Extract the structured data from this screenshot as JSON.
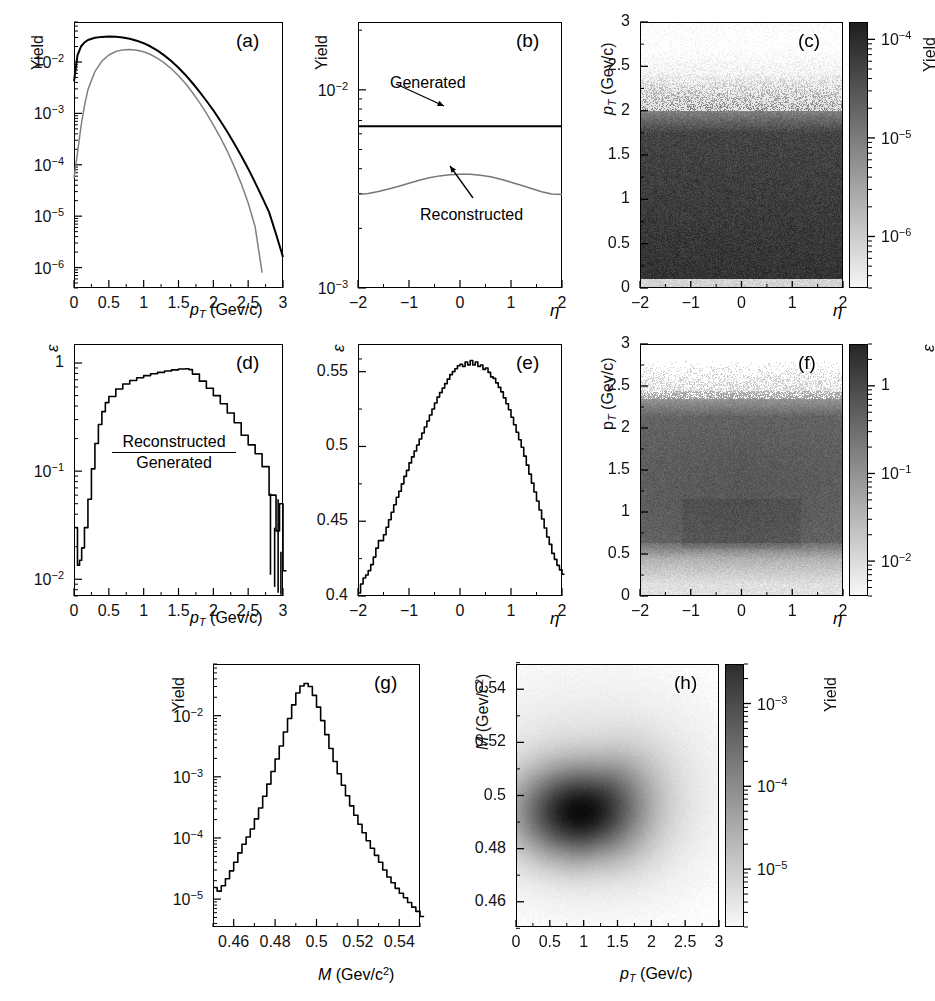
{
  "figure": {
    "kind": "multi-panel scientific figure",
    "panel_labels": [
      "(a)",
      "(b)",
      "(c)",
      "(d)",
      "(e)",
      "(f)",
      "(g)",
      "(h)"
    ]
  },
  "labels": {
    "yield": "Yield",
    "epsilon": "ε",
    "eta": "η",
    "pt_axis": "p_T (Gev/c)",
    "mass_axis": "M (Gev/c²)",
    "generated": "Generated",
    "reconstructed": "Reconstructed"
  },
  "chart_data": [
    {
      "id": "a",
      "panel": "(a)",
      "type": "line",
      "title": "",
      "xlabel": "p_T (Gev/c)",
      "ylabel": "Yield",
      "yscale": "log",
      "xlim": [
        0,
        3
      ],
      "ylim": [
        4e-07,
        0.06
      ],
      "xticks": [
        "0",
        "0.5",
        "1",
        "1.5",
        "2",
        "2.5",
        "3"
      ],
      "xtickvals": [
        0,
        0.5,
        1,
        1.5,
        2,
        2.5,
        3
      ],
      "yticks": [
        "10⁻²",
        "10⁻³",
        "10⁻⁴",
        "10⁻⁵",
        "10⁻⁶"
      ],
      "ytickvals": [
        0.01,
        0.001,
        0.0001,
        1e-05,
        1e-06
      ],
      "grid": false,
      "legend": "none",
      "series": [
        {
          "name": "Generated",
          "color": "#000000",
          "x": [
            0.0,
            0.05,
            0.1,
            0.15,
            0.2,
            0.3,
            0.4,
            0.5,
            0.6,
            0.7,
            0.8,
            0.9,
            1.0,
            1.1,
            1.2,
            1.3,
            1.4,
            1.5,
            1.6,
            1.7,
            1.8,
            1.9,
            2.0,
            2.1,
            2.2,
            2.3,
            2.4,
            2.5,
            2.6,
            2.7,
            2.8,
            2.9,
            3.0
          ],
          "y": [
            0.0042,
            0.0135,
            0.02,
            0.024,
            0.0268,
            0.0296,
            0.0308,
            0.0312,
            0.031,
            0.03,
            0.0283,
            0.026,
            0.0232,
            0.02,
            0.0166,
            0.0133,
            0.0103,
            0.0077,
            0.0056,
            0.0039,
            0.00265,
            0.00176,
            0.00115,
            0.00072,
            0.00044,
            0.00026,
            0.00015,
            8.4e-05,
            4.5e-05,
            2.35e-05,
            1.2e-05,
            4.5e-06,
            1.6e-06
          ]
        },
        {
          "name": "Reconstructed",
          "color": "#808080",
          "x": [
            0.0,
            0.05,
            0.1,
            0.15,
            0.2,
            0.3,
            0.4,
            0.5,
            0.6,
            0.7,
            0.8,
            0.9,
            1.0,
            1.1,
            1.2,
            1.3,
            1.4,
            1.5,
            1.6,
            1.7,
            1.8,
            1.9,
            2.0,
            2.1,
            2.2,
            2.3,
            2.4,
            2.5,
            2.6,
            2.7
          ],
          "y": [
            5.5e-05,
            0.00017,
            0.00055,
            0.0014,
            0.0029,
            0.0065,
            0.0104,
            0.0137,
            0.016,
            0.0172,
            0.0175,
            0.017,
            0.0158,
            0.014,
            0.0118,
            0.0095,
            0.0073,
            0.0054,
            0.0038,
            0.00255,
            0.00164,
            0.00101,
            0.0006,
            0.00034,
            0.000185,
            9.2e-05,
            4.3e-05,
            1.8e-05,
            6.2e-06,
            8e-07
          ]
        }
      ]
    },
    {
      "id": "b",
      "panel": "(b)",
      "type": "line",
      "xlabel": "η",
      "ylabel": "Yield",
      "yscale": "log",
      "xlim": [
        -2,
        2
      ],
      "ylim": [
        0.001,
        0.022
      ],
      "xticks": [
        "−2",
        "−1",
        "0",
        "1",
        "2"
      ],
      "xtickvals": [
        -2,
        -1,
        0,
        1,
        2
      ],
      "yticks": [
        "10⁻²",
        "10⁻³"
      ],
      "ytickvals": [
        0.01,
        0.001
      ],
      "annotations": [
        {
          "text": "Generated",
          "x": -1.35,
          "y": 0.0125
        },
        {
          "text": "Reconstructed",
          "x": 0.15,
          "y": 0.00195
        }
      ],
      "series": [
        {
          "name": "Generated",
          "color": "#000000",
          "x": [
            -2,
            -1.5,
            -1,
            -0.5,
            0,
            0.5,
            1,
            1.5,
            2
          ],
          "y": [
            0.00655,
            0.00655,
            0.00655,
            0.00655,
            0.00655,
            0.00655,
            0.00655,
            0.00655,
            0.00655
          ]
        },
        {
          "name": "Reconstructed",
          "color": "#777777",
          "x": [
            -2.0,
            -1.8,
            -1.6,
            -1.4,
            -1.2,
            -1.0,
            -0.8,
            -0.6,
            -0.4,
            -0.2,
            0.0,
            0.2,
            0.4,
            0.6,
            0.8,
            1.0,
            1.2,
            1.4,
            1.6,
            1.8,
            2.0
          ],
          "y": [
            0.00296,
            0.003,
            0.00307,
            0.00316,
            0.00326,
            0.00338,
            0.0035,
            0.0036,
            0.00368,
            0.00373,
            0.00375,
            0.00375,
            0.00371,
            0.00364,
            0.00354,
            0.00342,
            0.0033,
            0.00318,
            0.00306,
            0.00298,
            0.00296
          ]
        }
      ]
    },
    {
      "id": "c",
      "panel": "(c)",
      "type": "heatmap",
      "xlabel": "η",
      "ylabel": "p_T (Gev/c)",
      "xlim": [
        -2,
        2
      ],
      "ylim": [
        0,
        3
      ],
      "xticks": [
        "−2",
        "−1",
        "0",
        "1",
        "2"
      ],
      "xtickvals": [
        -2,
        -1,
        0,
        1,
        2
      ],
      "yticks": [
        "0",
        "0.5",
        "1",
        "1.5",
        "2",
        "2.5",
        "3"
      ],
      "ytickvals": [
        0,
        0.5,
        1,
        1.5,
        2,
        2.5,
        3
      ],
      "colorbar": {
        "label": "Yield",
        "scale": "log",
        "ticks": [
          "10⁻⁴",
          "10⁻⁵",
          "10⁻⁶"
        ],
        "tickvals": [
          0.0001,
          1e-05,
          1e-06
        ],
        "vmin": 3e-07,
        "vmax": 0.00015
      },
      "description": "Yield density in η vs p_T: dark (high yield) for p_T below ~1.8, fading to light above 2.3, faint band at p_T<0.1."
    },
    {
      "id": "d",
      "panel": "(d)",
      "type": "line",
      "xlabel": "p_T (Gev/c)",
      "ylabel": "ε",
      "yscale": "log",
      "xlim": [
        0,
        3
      ],
      "ylim": [
        0.007,
        1.5
      ],
      "xticks": [
        "0",
        "0.5",
        "1",
        "1.5",
        "2",
        "2.5",
        "3"
      ],
      "xtickvals": [
        0,
        0.5,
        1,
        1.5,
        2,
        2.5,
        3
      ],
      "yticks": [
        "1",
        "10⁻¹",
        "10⁻²"
      ],
      "ytickvals": [
        1,
        0.1,
        0.01
      ],
      "annotations": [
        {
          "text": "Reconstructed",
          "x": 1.0,
          "y": 0.3
        },
        {
          "text": "Generated",
          "x": 1.0,
          "y": 0.13
        }
      ],
      "series": [
        {
          "name": "efficiency",
          "color": "#000000",
          "x": [
            0.02,
            0.05,
            0.08,
            0.11,
            0.15,
            0.2,
            0.25,
            0.3,
            0.35,
            0.4,
            0.45,
            0.5,
            0.6,
            0.7,
            0.8,
            0.9,
            1.0,
            1.1,
            1.2,
            1.3,
            1.4,
            1.5,
            1.6,
            1.65,
            1.7,
            1.8,
            1.9,
            2.0,
            2.1,
            2.2,
            2.3,
            2.4,
            2.5,
            2.6,
            2.7,
            2.8,
            2.9,
            2.95,
            3.0
          ],
          "y": [
            0.03,
            0.0135,
            0.015,
            0.0195,
            0.03,
            0.055,
            0.105,
            0.18,
            0.27,
            0.355,
            0.43,
            0.49,
            0.575,
            0.64,
            0.69,
            0.73,
            0.765,
            0.795,
            0.82,
            0.845,
            0.865,
            0.88,
            0.885,
            0.87,
            0.79,
            0.68,
            0.585,
            0.5,
            0.42,
            0.345,
            0.28,
            0.215,
            0.175,
            0.145,
            0.11,
            0.06,
            0.028,
            0.05,
            0.012
          ]
        }
      ]
    },
    {
      "id": "e",
      "panel": "(e)",
      "type": "line",
      "xlabel": "η",
      "ylabel": "ε",
      "yscale": "linear",
      "xlim": [
        -2,
        2
      ],
      "ylim": [
        0.4,
        0.5685
      ],
      "xticks": [
        "−2",
        "−1",
        "0",
        "1",
        "2"
      ],
      "xtickvals": [
        -2,
        -1,
        0,
        1,
        2
      ],
      "yticks": [
        "0.55",
        "0.5",
        "0.45",
        "0.4"
      ],
      "ytickvals": [
        0.55,
        0.5,
        0.45,
        0.4
      ],
      "series": [
        {
          "name": "efficiency",
          "color": "#000000",
          "x": [
            -2.0,
            -1.95,
            -1.9,
            -1.85,
            -1.8,
            -1.75,
            -1.7,
            -1.65,
            -1.6,
            -1.55,
            -1.5,
            -1.45,
            -1.4,
            -1.35,
            -1.3,
            -1.25,
            -1.2,
            -1.15,
            -1.1,
            -1.05,
            -1.0,
            -0.95,
            -0.9,
            -0.85,
            -0.8,
            -0.75,
            -0.7,
            -0.65,
            -0.6,
            -0.55,
            -0.5,
            -0.45,
            -0.4,
            -0.35,
            -0.3,
            -0.25,
            -0.2,
            -0.15,
            -0.1,
            -0.05,
            0.0,
            0.05,
            0.1,
            0.15,
            0.2,
            0.25,
            0.3,
            0.35,
            0.4,
            0.45,
            0.5,
            0.55,
            0.6,
            0.65,
            0.7,
            0.75,
            0.8,
            0.85,
            0.9,
            0.95,
            1.0,
            1.05,
            1.1,
            1.15,
            1.2,
            1.25,
            1.3,
            1.35,
            1.4,
            1.45,
            1.5,
            1.55,
            1.6,
            1.65,
            1.7,
            1.75,
            1.8,
            1.85,
            1.9,
            1.95,
            2.0
          ],
          "y": [
            0.402,
            0.408,
            0.412,
            0.414,
            0.417,
            0.421,
            0.426,
            0.432,
            0.437,
            0.437,
            0.441,
            0.446,
            0.451,
            0.456,
            0.461,
            0.466,
            0.47,
            0.475,
            0.48,
            0.484,
            0.489,
            0.493,
            0.497,
            0.501,
            0.505,
            0.509,
            0.513,
            0.517,
            0.521,
            0.525,
            0.529,
            0.533,
            0.536,
            0.539,
            0.542,
            0.545,
            0.548,
            0.55,
            0.552,
            0.554,
            0.555,
            0.5535,
            0.5565,
            0.5545,
            0.5575,
            0.5545,
            0.5565,
            0.5535,
            0.5545,
            0.5515,
            0.5525,
            0.5495,
            0.5465,
            0.5455,
            0.5425,
            0.5395,
            0.5365,
            0.5325,
            0.5285,
            0.5245,
            0.5195,
            0.5145,
            0.5095,
            0.5045,
            0.4995,
            0.4935,
            0.4875,
            0.4815,
            0.4755,
            0.4695,
            0.4635,
            0.4575,
            0.4515,
            0.4455,
            0.4395,
            0.4345,
            0.4285,
            0.4245,
            0.4205,
            0.4175,
            0.4145
          ]
        }
      ]
    },
    {
      "id": "f",
      "panel": "(f)",
      "type": "heatmap",
      "xlabel": "η",
      "ylabel": "p_T (Gev/c)",
      "xlim": [
        -2,
        2
      ],
      "ylim": [
        0,
        3
      ],
      "xticks": [
        "−2",
        "−1",
        "0",
        "1",
        "2"
      ],
      "xtickvals": [
        -2,
        -1,
        0,
        1,
        2
      ],
      "yticks": [
        "0",
        "0.5",
        "1",
        "1.5",
        "2",
        "2.5",
        "3"
      ],
      "ytickvals": [
        0,
        0.5,
        1,
        1.5,
        2,
        2.5,
        3
      ],
      "colorbar": {
        "label": "ε",
        "scale": "log",
        "ticks": [
          "1",
          "10⁻¹",
          "10⁻²"
        ],
        "tickvals": [
          1,
          0.1,
          0.01
        ],
        "vmin": 0.004,
        "vmax": 3.0
      },
      "description": "Efficiency map in η vs p_T: mid-grey plateau for 0.7<p_T<2.2, lighter band below 0.5 and sparse speckle above 2.4."
    },
    {
      "id": "g",
      "panel": "(g)",
      "type": "line",
      "xlabel": "M (Gev/c²)",
      "ylabel": "Yield",
      "yscale": "log",
      "xlim": [
        0.45,
        0.55
      ],
      "ylim": [
        3.5e-06,
        0.07
      ],
      "xticks": [
        "0.46",
        "0.48",
        "0.5",
        "0.52",
        "0.54"
      ],
      "xtickvals": [
        0.46,
        0.48,
        0.5,
        0.52,
        0.54
      ],
      "yticks": [
        "10⁻²",
        "10⁻³",
        "10⁻⁴",
        "10⁻⁵"
      ],
      "ytickvals": [
        0.01,
        0.001,
        0.0001,
        1e-05
      ],
      "series": [
        {
          "name": "invariant mass",
          "color": "#000000",
          "x": [
            0.45,
            0.452,
            0.454,
            0.456,
            0.458,
            0.46,
            0.462,
            0.464,
            0.466,
            0.468,
            0.47,
            0.472,
            0.474,
            0.476,
            0.478,
            0.48,
            0.482,
            0.484,
            0.486,
            0.488,
            0.49,
            0.492,
            0.494,
            0.496,
            0.498,
            0.5,
            0.502,
            0.504,
            0.506,
            0.508,
            0.51,
            0.512,
            0.514,
            0.516,
            0.518,
            0.52,
            0.522,
            0.524,
            0.526,
            0.528,
            0.53,
            0.532,
            0.534,
            0.536,
            0.538,
            0.54,
            0.542,
            0.544,
            0.546,
            0.548,
            0.55
          ],
          "y": [
            1.55e-05,
            1.35e-05,
            1.65e-05,
            2.15e-05,
            2.9e-05,
            4e-05,
            5.7e-05,
            7.9e-05,
            0.000104,
            0.00014,
            0.000205,
            0.00031,
            0.00048,
            0.00076,
            0.00122,
            0.00196,
            0.0032,
            0.0054,
            0.009,
            0.015,
            0.0235,
            0.0305,
            0.0335,
            0.03,
            0.0215,
            0.0138,
            0.0083,
            0.0049,
            0.0029,
            0.00178,
            0.00112,
            0.00073,
            0.00049,
            0.000335,
            0.000235,
            0.000168,
            0.000122,
            9e-05,
            6.8e-05,
            5.2e-05,
            4e-05,
            3e-05,
            2.3e-05,
            1.85e-05,
            1.5e-05,
            1.25e-05,
            1.05e-05,
            8.8e-06,
            7.4e-06,
            6.3e-06,
            5.2e-06
          ]
        }
      ]
    },
    {
      "id": "h",
      "panel": "(h)",
      "type": "heatmap",
      "xlabel": "p_T (Gev/c)",
      "ylabel": "M (Gev/c²)",
      "xlim": [
        0,
        3
      ],
      "ylim": [
        0.4505,
        0.5495
      ],
      "xticks": [
        "0",
        "0.5",
        "1",
        "1.5",
        "2",
        "2.5",
        "3"
      ],
      "xtickvals": [
        0,
        0.5,
        1,
        1.5,
        2,
        2.5,
        3
      ],
      "yticks": [
        "0.46",
        "0.48",
        "0.5",
        "0.52",
        "0.54"
      ],
      "ytickvals": [
        0.46,
        0.48,
        0.5,
        0.52,
        0.54
      ],
      "colorbar": {
        "label": "Yield",
        "scale": "log",
        "ticks": [
          "10⁻³",
          "10⁻⁴",
          "10⁻⁵"
        ],
        "tickvals": [
          0.001,
          0.0001,
          1e-05
        ],
        "vmin": 2e-06,
        "vmax": 0.003
      },
      "description": "Two-dimensional yield blob centred near p_T ≈ 0.9 Gev/c and M ≈ 0.494 Gev/c², extending to higher mass at larger p_T."
    }
  ]
}
